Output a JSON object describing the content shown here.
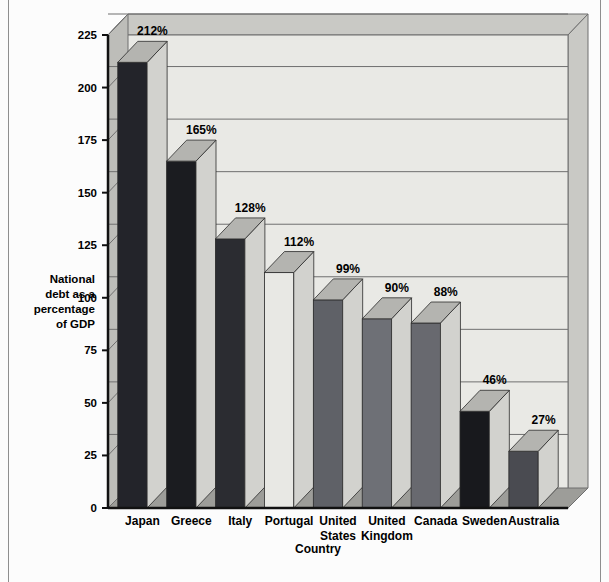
{
  "chart_data": {
    "type": "bar",
    "title": "",
    "subtitle": "",
    "xlabel": "Country",
    "ylabel": "National debt as a percentage of  GDP",
    "ylabel_lines": [
      "National",
      "debt as a",
      "percentage",
      "of  GDP"
    ],
    "categories": [
      "Japan",
      "Greece",
      "Italy",
      "Portugal",
      "United States",
      "United Kingdom",
      "Canada",
      "Sweden",
      "Australia"
    ],
    "category_lines": [
      [
        "Japan"
      ],
      [
        "Greece"
      ],
      [
        "Italy"
      ],
      [
        "Portugal"
      ],
      [
        "United",
        "States"
      ],
      [
        "United",
        "Kingdom"
      ],
      [
        "Canada"
      ],
      [
        "Sweden"
      ],
      [
        "Australia"
      ]
    ],
    "values": [
      212,
      165,
      128,
      112,
      99,
      90,
      88,
      46,
      27
    ],
    "data_labels": [
      "212%",
      "165%",
      "128%",
      "112%",
      "99%",
      "90%",
      "88%",
      "46%",
      "27%"
    ],
    "bar_colors": [
      "#23242a",
      "#1b1c20",
      "#2b2c31",
      "#e8e8e4",
      "#5f6167",
      "#6e7076",
      "#68696f",
      "#18191d",
      "#4a4b51"
    ],
    "ylim": [
      0,
      225
    ],
    "yticks": [
      0,
      25,
      50,
      75,
      100,
      125,
      150,
      175,
      200,
      225
    ],
    "ytick_labels": [
      "0",
      "25",
      "50",
      "75",
      "100",
      "125",
      "150",
      "175",
      "200",
      "225"
    ],
    "grid": true,
    "grid_axis": "y",
    "legend": false,
    "style": "3d-column",
    "plot_bg": "#e9e9e5",
    "wall_color": "#bdbdb9",
    "floor_color": "#9d9d99",
    "gridline_color": "#6f6f6f"
  }
}
